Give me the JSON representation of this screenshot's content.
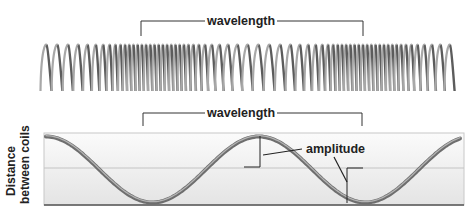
{
  "diagram": {
    "coil": {
      "label_wavelength": "wavelength",
      "wavelength_span_px": [
        141,
        363
      ]
    },
    "graph": {
      "label_wavelength": "wavelength",
      "label_amplitude": "amplitude",
      "ylabel_line1": "Distance",
      "ylabel_line2": "between coils",
      "colors": {
        "wave": "#7a7a7a",
        "wave_highlight": "#b5b5b5",
        "box_fill_top": "#ffffff",
        "box_fill_bottom": "#e6e6e6",
        "axis": "#555555",
        "midline": "#c4c4c4",
        "annotation": "#222222"
      }
    }
  }
}
